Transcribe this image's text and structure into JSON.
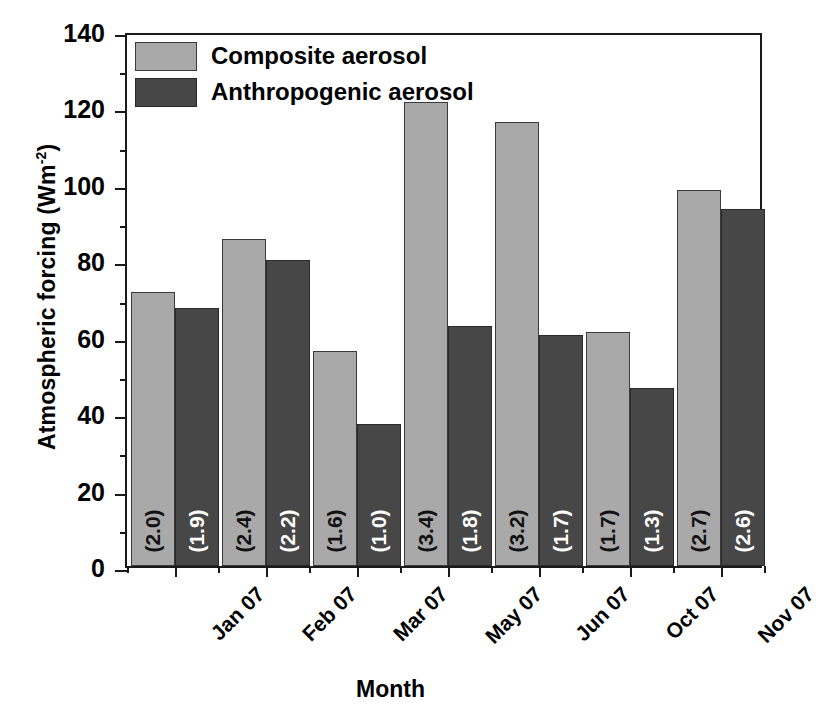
{
  "chart_data": {
    "type": "bar",
    "title": "",
    "xlabel": "Month",
    "ylabel": "Atmospheric forcing (Wm",
    "ylabel_sup": "-2",
    "ylabel_close": ")",
    "categories": [
      "Jan 07",
      "Feb 07",
      "Mar 07",
      "May 07",
      "Jun 07",
      "Oct 07",
      "Nov 07"
    ],
    "ylim": [
      0,
      140
    ],
    "yticks": [
      0,
      20,
      40,
      60,
      80,
      100,
      120,
      140
    ],
    "ytick_labels": [
      "0",
      "20",
      "40",
      "60",
      "80",
      "100",
      "120",
      "140"
    ],
    "yminor_ticks": [
      10,
      30,
      50,
      70,
      90,
      110,
      130
    ],
    "grid": false,
    "legend_position": "top-left",
    "series": [
      {
        "name": "Composite aerosol",
        "color": "#a9a9a9",
        "values": [
          71.8,
          85.5,
          56.2,
          121.5,
          116.3,
          61.3,
          98.3
        ],
        "point_labels": [
          "(2.0)",
          "(2.4)",
          "(1.6)",
          "(3.4)",
          "(3.2)",
          "(1.7)",
          "(2.7)"
        ]
      },
      {
        "name": "Anthropogenic aerosol",
        "color": "#474747",
        "values": [
          67.4,
          80.2,
          37.2,
          62.8,
          60.4,
          46.6,
          93.4
        ],
        "point_labels": [
          "(1.9)",
          "(2.2)",
          "(1.0)",
          "(1.8)",
          "(1.7)",
          "(1.3)",
          "(2.6)"
        ]
      }
    ]
  },
  "legend": {
    "items": [
      {
        "label": "Composite aerosol",
        "color": "#a9a9a9"
      },
      {
        "label": "Anthropogenic aerosol",
        "color": "#474747"
      }
    ]
  },
  "colors": {
    "composite": "#a9a9a9",
    "anthropogenic": "#474747",
    "axis": "#1a1a1a",
    "background": "#ffffff"
  }
}
